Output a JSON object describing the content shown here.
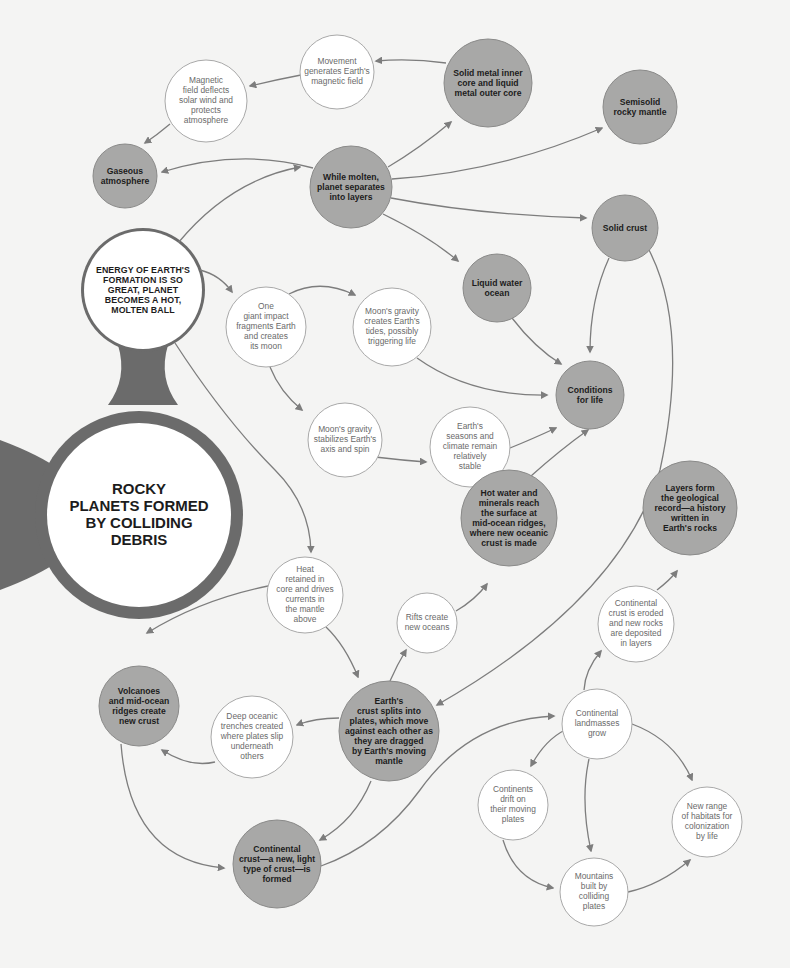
{
  "diagram": {
    "colors": {
      "background": "#f4f4f3",
      "filled_node": "#a8a8a7",
      "filled_stroke": "#8a8a89",
      "outline_node": "#ffffff",
      "outline_stroke": "#a9a9a9",
      "hub_ring": "#6b6b6b",
      "arrow": "#7d7d7d"
    },
    "nodes": [
      {
        "id": "hub",
        "label": "ROCKY PLANETS FORMED BY COLLIDING DEBRIS",
        "lines": [
          "ROCKY",
          "PLANETS FORMED",
          "BY COLLIDING",
          "DEBRIS"
        ],
        "style": "hub",
        "cx": 139,
        "cy": 515,
        "r": 92
      },
      {
        "id": "energy",
        "label": "ENERGY OF EARTH'S FORMATION IS SO GREAT, PLANET BECOMES A HOT, MOLTEN BALL",
        "lines": [
          "ENERGY OF EARTH'S",
          "FORMATION IS SO",
          "GREAT, PLANET",
          "BECOMES A HOT,",
          "MOLTEN BALL"
        ],
        "style": "caps",
        "cx": 143,
        "cy": 290,
        "r": 59
      },
      {
        "id": "molten",
        "label": "While molten, planet separates into layers",
        "lines": [
          "While molten,",
          "planet separates",
          "into layers"
        ],
        "style": "dark",
        "cx": 351,
        "cy": 187,
        "r": 41
      },
      {
        "id": "core",
        "label": "Solid metal inner core and liquid metal outer core",
        "lines": [
          "Solid metal inner",
          "core and liquid",
          "metal outer core"
        ],
        "style": "dark",
        "cx": 488,
        "cy": 83,
        "r": 44
      },
      {
        "id": "mantle",
        "label": "Semisolid rocky mantle",
        "lines": [
          "Semisolid",
          "rocky mantle"
        ],
        "style": "dark",
        "cx": 640,
        "cy": 107,
        "r": 37
      },
      {
        "id": "movement",
        "label": "Movement generates Earth's magnetic field",
        "lines": [
          "Movement",
          "generates Earth's",
          "magnetic field"
        ],
        "style": "light",
        "cx": 337,
        "cy": 72,
        "r": 37
      },
      {
        "id": "magnetic",
        "label": "Magnetic field deflects solar wind and protects atmosphere",
        "lines": [
          "Magnetic",
          "field deflects",
          "solar wind and",
          "protects",
          "atmosphere"
        ],
        "style": "light",
        "cx": 206,
        "cy": 101,
        "r": 41
      },
      {
        "id": "atmosphere",
        "label": "Gaseous atmosphere",
        "lines": [
          "Gaseous",
          "atmosphere"
        ],
        "style": "dark",
        "cx": 125,
        "cy": 176,
        "r": 32
      },
      {
        "id": "solidcrust",
        "label": "Solid crust",
        "lines": [
          "Solid crust"
        ],
        "style": "dark",
        "cx": 625,
        "cy": 228,
        "r": 33
      },
      {
        "id": "ocean",
        "label": "Liquid water ocean",
        "lines": [
          "Liquid water",
          "ocean"
        ],
        "style": "dark",
        "cx": 497,
        "cy": 288,
        "r": 34
      },
      {
        "id": "impact",
        "label": "One giant impact fragments Earth and creates its moon",
        "lines": [
          "One",
          "giant impact",
          "fragments Earth",
          "and creates",
          "its moon"
        ],
        "style": "light",
        "cx": 266,
        "cy": 327,
        "r": 40
      },
      {
        "id": "tides",
        "label": "Moon's gravity creates Earth's tides, possibly triggering life",
        "lines": [
          "Moon's gravity",
          "creates Earth's",
          "tides, possibly",
          "triggering life"
        ],
        "style": "light",
        "cx": 392,
        "cy": 327,
        "r": 39
      },
      {
        "id": "life",
        "label": "Conditions for life",
        "lines": [
          "Conditions",
          "for life"
        ],
        "style": "dark",
        "cx": 590,
        "cy": 395,
        "r": 34
      },
      {
        "id": "stabilizes",
        "label": "Moon's gravity stabilizes Earth's axis and spin",
        "lines": [
          "Moon's gravity",
          "stabilizes Earth's",
          "axis and spin"
        ],
        "style": "light",
        "cx": 345,
        "cy": 440,
        "r": 37
      },
      {
        "id": "seasons",
        "label": "Earth's seasons and climate remain relatively stable",
        "lines": [
          "Earth's",
          "seasons and",
          "climate remain",
          "relatively",
          "stable"
        ],
        "style": "light",
        "cx": 470,
        "cy": 447,
        "r": 40
      },
      {
        "id": "hotwater",
        "label": "Hot water and minerals reach the surface at mid-ocean ridges, where new oceanic crust is made",
        "lines": [
          "Hot water and",
          "minerals reach",
          "the surface at",
          "mid-ocean ridges,",
          "where new oceanic",
          "crust is made"
        ],
        "style": "dark",
        "cx": 509,
        "cy": 518,
        "r": 48
      },
      {
        "id": "layers",
        "label": "Layers form the geological record—a history written in Earth's rocks",
        "lines": [
          "Layers form",
          "the geological",
          "record—a history",
          "written in",
          "Earth's rocks"
        ],
        "style": "dark",
        "cx": 690,
        "cy": 508,
        "r": 47
      },
      {
        "id": "heat",
        "label": "Heat retained in core and drives currents in the mantle above",
        "lines": [
          "Heat",
          "retained in",
          "core and drives",
          "currents in",
          "the mantle",
          "above"
        ],
        "style": "light",
        "cx": 305,
        "cy": 595,
        "r": 38
      },
      {
        "id": "rifts",
        "label": "Rifts create new oceans",
        "lines": [
          "Rifts create",
          "new oceans"
        ],
        "style": "light",
        "cx": 427,
        "cy": 623,
        "r": 30
      },
      {
        "id": "eroded",
        "label": "Continental crust is eroded and new rocks are deposited in layers",
        "lines": [
          "Continental",
          "crust is eroded",
          "and new rocks",
          "are deposited",
          "in layers"
        ],
        "style": "light",
        "cx": 636,
        "cy": 624,
        "r": 38
      },
      {
        "id": "volcanoes",
        "label": "Volcanoes and mid-ocean ridges create new crust",
        "lines": [
          "Volcanoes",
          "and mid-ocean",
          "ridges create",
          "new crust"
        ],
        "style": "dark",
        "cx": 139,
        "cy": 706,
        "r": 40
      },
      {
        "id": "plates",
        "label": "Earth's crust splits into plates, which move against each other as they are dragged by Earth's moving mantle",
        "lines": [
          "Earth's",
          "crust splits into",
          "plates, which move",
          "against each other as",
          "they are dragged",
          "by Earth's moving",
          "mantle"
        ],
        "style": "dark",
        "cx": 389,
        "cy": 731,
        "r": 50
      },
      {
        "id": "trenches",
        "label": "Deep oceanic trenches created where plates slip underneath others",
        "lines": [
          "Deep oceanic",
          "trenches created",
          "where plates slip",
          "underneath",
          "others"
        ],
        "style": "light",
        "cx": 252,
        "cy": 737,
        "r": 41
      },
      {
        "id": "landmasses",
        "label": "Continental landmasses grow",
        "lines": [
          "Continental",
          "landmasses",
          "grow"
        ],
        "style": "light",
        "cx": 597,
        "cy": 724,
        "r": 35
      },
      {
        "id": "drift",
        "label": "Continents drift on their moving plates",
        "lines": [
          "Continents",
          "drift on",
          "their moving",
          "plates"
        ],
        "style": "light",
        "cx": 513,
        "cy": 805,
        "r": 35
      },
      {
        "id": "habitats",
        "label": "New range of habitats for colonization by life",
        "lines": [
          "New range",
          "of habitats for",
          "colonization",
          "by life"
        ],
        "style": "light",
        "cx": 707,
        "cy": 822,
        "r": 35
      },
      {
        "id": "contcrust",
        "label": "Continental crust—a new, light type of crust—is formed",
        "lines": [
          "Continental",
          "crust—a new, light",
          "type of crust—is",
          "formed"
        ],
        "style": "dark",
        "cx": 277,
        "cy": 864,
        "r": 44
      },
      {
        "id": "mountains",
        "label": "Mountains built by colliding plates",
        "lines": [
          "Mountains",
          "built by",
          "colliding",
          "plates"
        ],
        "style": "light",
        "cx": 594,
        "cy": 892,
        "r": 34
      }
    ],
    "edges": [
      {
        "from": "energy",
        "to": "molten",
        "path": "M178,243 Q230,180 300,167"
      },
      {
        "from": "energy",
        "to": "impact",
        "path": "M200,270 Q220,275 232,292"
      },
      {
        "from": "energy",
        "to": "heat",
        "path": "M175,343 Q225,420 275,470 Q310,505 311,552"
      },
      {
        "from": "molten",
        "to": "atmosphere",
        "path": "M313,168 Q240,148 162,172"
      },
      {
        "from": "molten",
        "to": "core",
        "path": "M388,167 Q420,148 451,122"
      },
      {
        "from": "molten",
        "to": "mantle",
        "path": "M392,179 Q500,172 602,128"
      },
      {
        "from": "molten",
        "to": "solidcrust",
        "path": "M391,198 Q480,215 586,218"
      },
      {
        "from": "molten",
        "to": "ocean",
        "path": "M383,214 Q430,237 458,261"
      },
      {
        "from": "core",
        "to": "movement",
        "path": "M446,63 Q410,58 376,61"
      },
      {
        "from": "movement",
        "to": "magnetic",
        "path": "M301,75 Q275,80 250,86"
      },
      {
        "from": "magnetic",
        "to": "atmosphere",
        "path": "M170,124 Q157,135 145,143"
      },
      {
        "from": "impact",
        "to": "tides",
        "path": "M289,294 Q320,278 355,295"
      },
      {
        "from": "impact",
        "to": "stabilizes",
        "path": "M270,367 Q280,392 302,410"
      },
      {
        "from": "tides",
        "to": "life",
        "path": "M417,358 Q470,396 547,395"
      },
      {
        "from": "stabilizes",
        "to": "seasons",
        "path": "M375,457 Q400,460 426,462"
      },
      {
        "from": "seasons",
        "to": "life",
        "path": "M510,448 Q530,440 556,428"
      },
      {
        "from": "ocean",
        "to": "life",
        "path": "M512,318 Q535,348 561,364"
      },
      {
        "from": "solidcrust",
        "to": "life",
        "path": "M609,258 Q590,300 590,352"
      },
      {
        "from": "solidcrust",
        "to": "plates",
        "path": "M649,250 Q690,330 660,470 Q620,600 437,705"
      },
      {
        "from": "hotwater",
        "to": "life",
        "path": "M531,476 Q560,450 588,430"
      },
      {
        "from": "heat",
        "to": "volcanoes",
        "path": "M268,586 Q200,600 147,633"
      },
      {
        "from": "heat",
        "to": "plates",
        "path": "M326,627 Q345,645 358,677"
      },
      {
        "from": "plates",
        "to": "rifts",
        "path": "M390,681 Q397,665 406,650"
      },
      {
        "from": "rifts",
        "to": "hotwater",
        "path": "M456,611 Q475,600 487,584"
      },
      {
        "from": "plates",
        "to": "trenches",
        "path": "M339,718 Q315,718 297,725"
      },
      {
        "from": "trenches",
        "to": "volcanoes",
        "path": "M215,762 Q190,768 162,750"
      },
      {
        "from": "volcanoes",
        "to": "contcrust",
        "path": "M121,744 Q130,860 224,868"
      },
      {
        "from": "plates",
        "to": "contcrust",
        "path": "M371,781 Q355,820 320,840"
      },
      {
        "from": "contcrust",
        "to": "landmasses",
        "path": "M321,866 Q380,845 420,790 Q470,720 554,716"
      },
      {
        "from": "landmasses",
        "to": "eroded",
        "path": "M584,690 Q585,670 601,651"
      },
      {
        "from": "eroded",
        "to": "layers",
        "path": "M657,590 Q670,580 677,571"
      },
      {
        "from": "landmasses",
        "to": "drift",
        "path": "M565,730 Q545,740 531,766"
      },
      {
        "from": "landmasses",
        "to": "mountains",
        "path": "M589,759 Q580,800 591,851"
      },
      {
        "from": "landmasses",
        "to": "habitats",
        "path": "M632,724 Q675,740 692,780"
      },
      {
        "from": "drift",
        "to": "mountains",
        "path": "M503,840 Q515,880 553,888"
      },
      {
        "from": "mountains",
        "to": "habitats",
        "path": "M628,892 Q660,885 690,860"
      }
    ]
  }
}
